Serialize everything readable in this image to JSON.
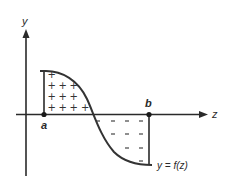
{
  "diagram": {
    "type": "definite-integral-area",
    "axes": {
      "vertical_label": "y",
      "horizontal_label": "z"
    },
    "points": {
      "a_label": "a",
      "b_label": "b"
    },
    "curve_label": "y = f(z)",
    "regions": {
      "positive": {
        "sign": "+",
        "rows": [
          1,
          2,
          3,
          4
        ]
      },
      "negative": {
        "sign": "–",
        "rows": [
          4,
          3,
          2,
          1
        ]
      }
    },
    "colors": {
      "line": "#2a2a2a",
      "curve": "#333333",
      "background": "#ffffff"
    }
  }
}
